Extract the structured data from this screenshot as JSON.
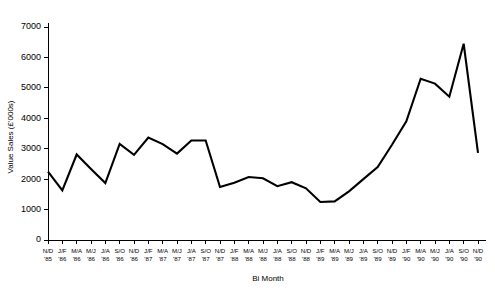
{
  "chart_data": {
    "type": "line",
    "title": "",
    "xlabel": "Bi Month",
    "ylabel": "Value Sales (£'000s)",
    "ylim": [
      0,
      7000
    ],
    "yticks": [
      0,
      1000,
      2000,
      3000,
      4000,
      5000,
      6000,
      7000
    ],
    "ytick_labels": [
      "0",
      "1000",
      "2000",
      "3000",
      "4000",
      "5000",
      "6000",
      "7000"
    ],
    "grid": false,
    "legend": false,
    "categories": [
      "N/D '85",
      "J/F '86",
      "M/A '86",
      "M/J '86",
      "J/A '86",
      "S/O '86",
      "N/D '86",
      "J/F '87",
      "M/A '87",
      "M/J '87",
      "J/A '87",
      "S/O '87",
      "N/D '87",
      "J/F '88",
      "M/A '88",
      "M/J '88",
      "J/A '88",
      "S/O '88",
      "N/D '88",
      "J/F '89",
      "M/A '89",
      "M/J '89",
      "J/A '89",
      "S/O '89",
      "N/D '89",
      "J/F '90",
      "M/A '90",
      "M/J '90",
      "J/A '90",
      "S/O '90",
      "N/D '90"
    ],
    "xtick_labels_top": [
      "N/D",
      "J/F",
      "M/A",
      "M/J",
      "J/A",
      "S/O",
      "N/D",
      "J/F",
      "M/A",
      "M/J",
      "J/A",
      "S/O",
      "N/D",
      "J/F",
      "M/A",
      "M/J",
      "J/A",
      "S/O",
      "N/D",
      "J/F",
      "M/A",
      "M/J",
      "J/A",
      "S/O",
      "N/D",
      "J/F",
      "M/A",
      "M/J",
      "J/A",
      "S/O",
      "N/D"
    ],
    "xtick_labels_bottom": [
      "'85",
      "'86",
      "'86",
      "'86",
      "'86",
      "'86",
      "'86",
      "'87",
      "'87",
      "'87",
      "'87",
      "'87",
      "'87",
      "'88",
      "'88",
      "'88",
      "'88",
      "'88",
      "'88",
      "'89",
      "'89",
      "'89",
      "'89",
      "'89",
      "'89",
      "'90",
      "'90",
      "'90",
      "'90",
      "'90",
      "'90"
    ],
    "values": [
      2250,
      1630,
      2810,
      2330,
      1870,
      3160,
      2800,
      3370,
      3150,
      2840,
      3270,
      3270,
      1740,
      1880,
      2070,
      2030,
      1770,
      1900,
      1700,
      1250,
      1270,
      1600,
      2000,
      2400,
      3130,
      3900,
      5300,
      5140,
      4710,
      6450,
      2860
    ],
    "series_name": "Value Sales",
    "line_color": "#000000",
    "axis_color": "#000000",
    "background_color": "#ffffff"
  }
}
